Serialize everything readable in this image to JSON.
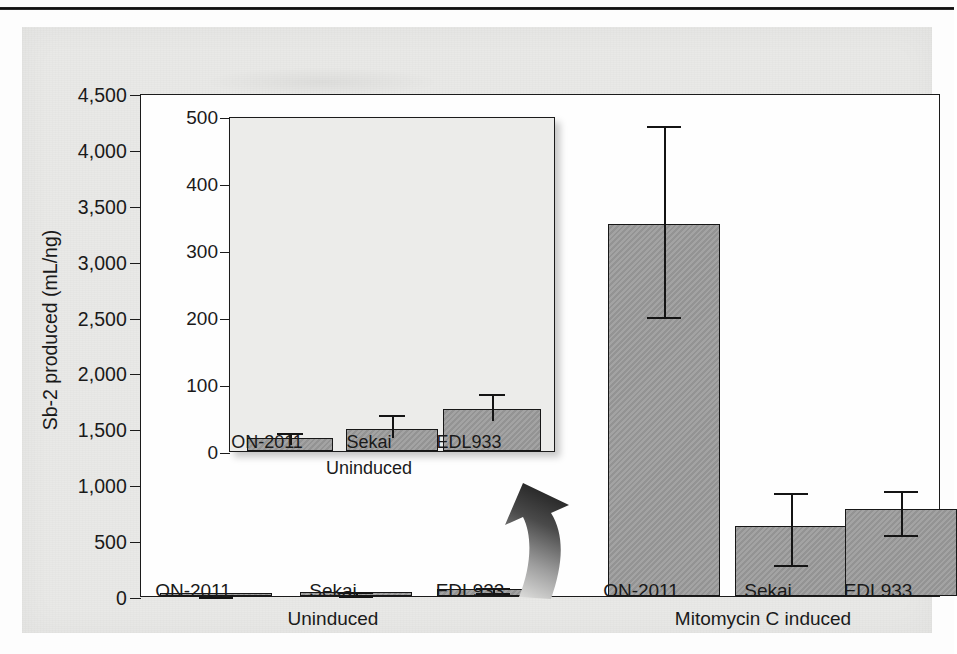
{
  "figure": {
    "y_axis_title": "Sb-2 produced (mL/ng)",
    "bar_fill_color": "#9a9a9a",
    "bar_edge_color": "#171717",
    "panel_background": "#e9e9e7",
    "plot_background": "#fefefe",
    "inset_background": "#ececea"
  },
  "chart_data": {
    "type": "bar",
    "title": "",
    "xlabel": "",
    "ylabel": "Sb-2 produced (mL/ng)",
    "ylim": [
      0,
      4500
    ],
    "yticks": [
      0,
      500,
      1000,
      1500,
      2000,
      2500,
      3000,
      3500,
      4000,
      4500
    ],
    "ytick_labels": [
      "0",
      "500",
      "1,000",
      "1,500",
      "2,000",
      "2,500",
      "3,000",
      "3,500",
      "4,000",
      "4,500"
    ],
    "grid": false,
    "legend": "none",
    "group_labels": [
      "Uninduced",
      "Mitomycin C induced"
    ],
    "categories": [
      "ON-2011",
      "Sekai",
      "EDL933",
      "ON-2011",
      "Sekai",
      "EDL933"
    ],
    "values": [
      20,
      33,
      63,
      3330,
      630,
      775
    ],
    "err_low": [
      12,
      22,
      48,
      2510,
      295,
      565
    ],
    "err_high": [
      30,
      56,
      88,
      4225,
      940,
      955
    ],
    "bars": [
      {
        "group": "Uninduced",
        "category": "ON-2011",
        "value": 20,
        "err_low": 12,
        "err_high": 30
      },
      {
        "group": "Uninduced",
        "category": "Sekai",
        "value": 33,
        "err_low": 22,
        "err_high": 56
      },
      {
        "group": "Uninduced",
        "category": "EDL933",
        "value": 63,
        "err_low": 48,
        "err_high": 88
      },
      {
        "group": "Mitomycin C induced",
        "category": "ON-2011",
        "value": 3330,
        "err_low": 2510,
        "err_high": 4225
      },
      {
        "group": "Mitomycin C induced",
        "category": "Sekai",
        "value": 630,
        "err_low": 295,
        "err_high": 940
      },
      {
        "group": "Mitomycin C induced",
        "category": "EDL933",
        "value": 775,
        "err_low": 565,
        "err_high": 955
      }
    ],
    "inset": {
      "type": "bar",
      "title": "",
      "ylabel": "",
      "ylim": [
        0,
        500
      ],
      "yticks": [
        0,
        100,
        200,
        300,
        400,
        500
      ],
      "ytick_labels": [
        "0",
        "100",
        "200",
        "300",
        "400",
        "500"
      ],
      "grid": false,
      "group_labels": [
        "Uninduced"
      ],
      "categories": [
        "ON-2011",
        "Sekai",
        "EDL933"
      ],
      "values": [
        20,
        33,
        63
      ],
      "err_low": [
        12,
        22,
        48
      ],
      "err_high": [
        30,
        56,
        88
      ],
      "bars": [
        {
          "category": "ON-2011",
          "value": 20,
          "err_low": 12,
          "err_high": 30
        },
        {
          "category": "Sekai",
          "value": 33,
          "err_low": 22,
          "err_high": 56
        },
        {
          "category": "EDL933",
          "value": 63,
          "err_low": 48,
          "err_high": 88
        }
      ]
    },
    "annotations": [
      {
        "name": "magnify-arrow",
        "text": "",
        "from": "Uninduced bars",
        "to": "Inset panel"
      }
    ]
  }
}
